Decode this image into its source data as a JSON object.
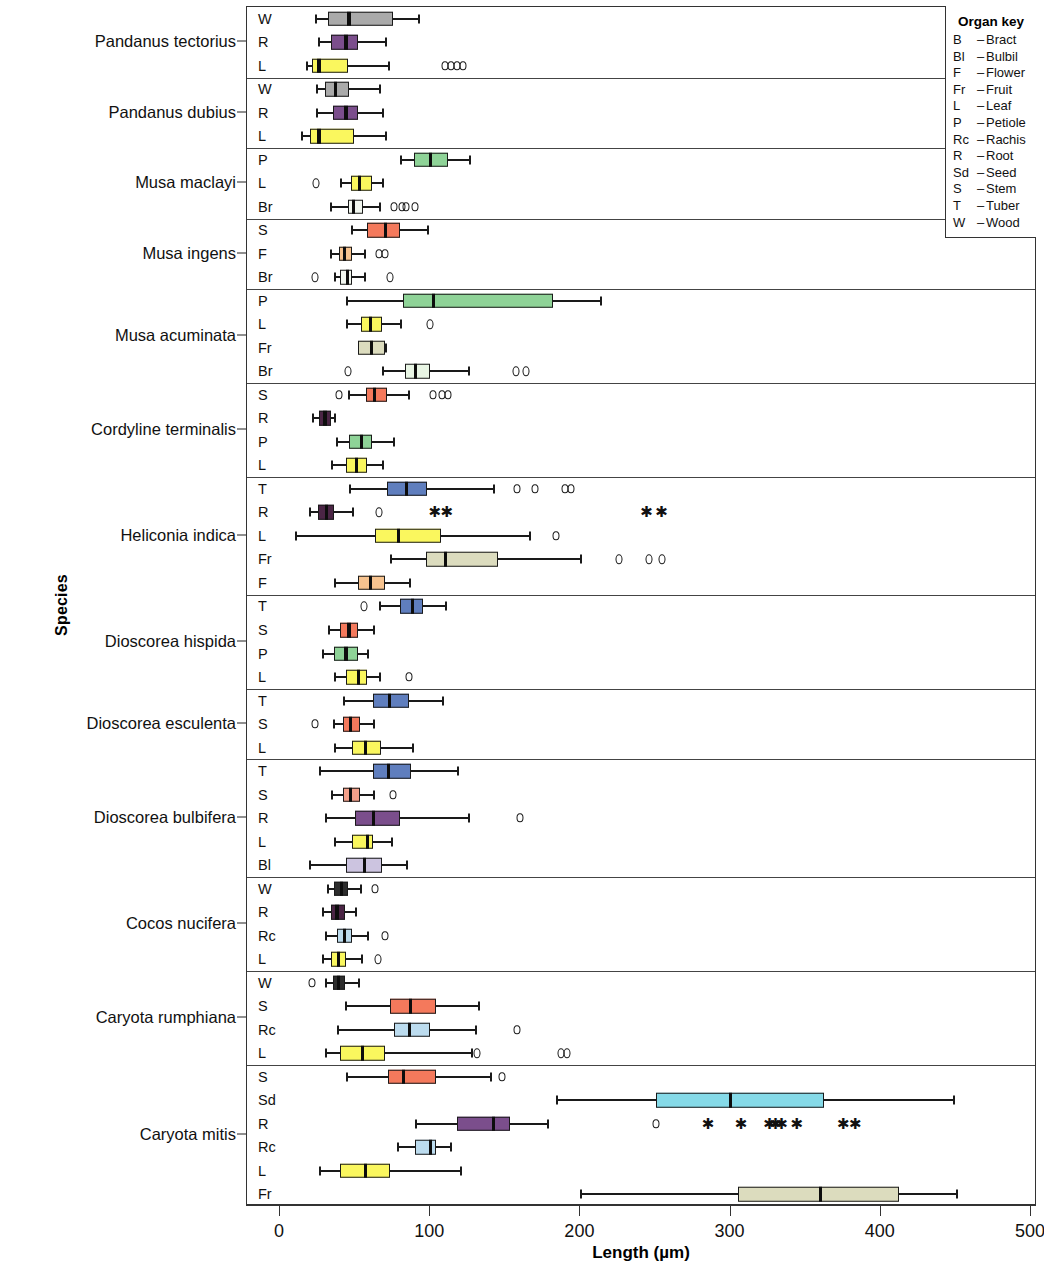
{
  "chart_data": {
    "type": "box",
    "title": "",
    "xlabel": "Length (µm)",
    "ylabel": "Species",
    "xlim": [
      0,
      500
    ],
    "xticks": [
      0,
      100,
      200,
      300,
      400,
      500
    ],
    "xtick_labels": [
      "0",
      "100",
      "200",
      "300",
      "400",
      "500"
    ],
    "grid": false,
    "legend_position": "top-right",
    "units": "micrometres",
    "organ_key": {
      "title": "Organ key",
      "entries": [
        {
          "abbr": "B",
          "dash": "–",
          "name": "Bract"
        },
        {
          "abbr": "Bl",
          "dash": "–",
          "name": "Bulbil"
        },
        {
          "abbr": "F",
          "dash": "–",
          "name": "Flower"
        },
        {
          "abbr": "Fr",
          "dash": "–",
          "name": "Fruit"
        },
        {
          "abbr": "L",
          "dash": "–",
          "name": "Leaf"
        },
        {
          "abbr": "P",
          "dash": "–",
          "name": "Petiole"
        },
        {
          "abbr": "Rc",
          "dash": "–",
          "name": "Rachis"
        },
        {
          "abbr": "R",
          "dash": "–",
          "name": "Root"
        },
        {
          "abbr": "Sd",
          "dash": "–",
          "name": "Seed"
        },
        {
          "abbr": "S",
          "dash": "–",
          "name": "Stem"
        },
        {
          "abbr": "T",
          "dash": "–",
          "name": "Tuber"
        },
        {
          "abbr": "W",
          "dash": "–",
          "name": "Wood"
        }
      ]
    },
    "organ_colors": {
      "B": "#e8f5e4",
      "Bl": "#ccc4e0",
      "F": "#f7c38f",
      "Fr": "#dcdcbe",
      "L": "#faf75e",
      "P": "#8ed397",
      "Rc": "#bcdcef",
      "R": "#7b4e8c",
      "Sd": "#85dae8",
      "S": "#f4795c",
      "T": "#5f7ebe",
      "W": "#aaaaaa",
      "Br": "#e8f5e4"
    },
    "groups": [
      {
        "species": "Pandanus tectorius",
        "rows": [
          {
            "organ": "W",
            "color": "#aaaaaa",
            "whisker_low": 23,
            "q1": 32,
            "median": 46,
            "q3": 75,
            "whisker_high": 92,
            "outliers": [],
            "extremes": []
          },
          {
            "organ": "R",
            "color": "#7b4e8c",
            "whisker_low": 25,
            "q1": 34,
            "median": 44,
            "q3": 52,
            "whisker_high": 70,
            "outliers": [],
            "extremes": []
          },
          {
            "organ": "L",
            "color": "#faf75e",
            "whisker_low": 17,
            "q1": 21,
            "median": 26,
            "q3": 45,
            "whisker_high": 72,
            "outliers": [
              110,
              114,
              118,
              122
            ],
            "extremes": []
          }
        ]
      },
      {
        "species": "Pandanus dubius",
        "rows": [
          {
            "organ": "W",
            "color": "#aaaaaa",
            "whisker_low": 24,
            "q1": 30,
            "median": 37,
            "q3": 46,
            "whisker_high": 66,
            "outliers": [],
            "extremes": []
          },
          {
            "organ": "R",
            "color": "#7b4e8c",
            "whisker_low": 24,
            "q1": 35,
            "median": 44,
            "q3": 52,
            "whisker_high": 68,
            "outliers": [],
            "extremes": []
          },
          {
            "organ": "L",
            "color": "#faf75e",
            "whisker_low": 14,
            "q1": 20,
            "median": 26,
            "q3": 49,
            "whisker_high": 70,
            "outliers": [],
            "extremes": []
          }
        ]
      },
      {
        "species": "Musa maclayi",
        "rows": [
          {
            "organ": "P",
            "color": "#8ed397",
            "whisker_low": 80,
            "q1": 89,
            "median": 100,
            "q3": 112,
            "whisker_high": 126,
            "outliers": [],
            "extremes": []
          },
          {
            "organ": "L",
            "color": "#faf75e",
            "whisker_low": 40,
            "q1": 47,
            "median": 53,
            "q3": 61,
            "whisker_high": 68,
            "outliers": [
              24
            ],
            "extremes": []
          },
          {
            "organ": "Br",
            "color": "#f2f7f0",
            "whisker_low": 33,
            "q1": 45,
            "median": 49,
            "q3": 55,
            "whisker_high": 66,
            "outliers": [
              76,
              81,
              84,
              90
            ],
            "extremes": []
          }
        ]
      },
      {
        "species": "Musa ingens",
        "rows": [
          {
            "organ": "S",
            "color": "#f4795c",
            "whisker_low": 47,
            "q1": 58,
            "median": 70,
            "q3": 80,
            "whisker_high": 98,
            "outliers": [],
            "extremes": []
          },
          {
            "organ": "F",
            "color": "#f7c38f",
            "whisker_low": 33,
            "q1": 39,
            "median": 43,
            "q3": 48,
            "whisker_high": 56,
            "outliers": [
              66,
              70
            ],
            "extremes": []
          },
          {
            "organ": "Br",
            "color": "#f2f7f0",
            "whisker_low": 36,
            "q1": 40,
            "median": 45,
            "q3": 48,
            "whisker_high": 56,
            "outliers": [
              23,
              73
            ],
            "extremes": []
          }
        ]
      },
      {
        "species": "Musa acuminata",
        "rows": [
          {
            "organ": "P",
            "color": "#8ed397",
            "whisker_low": 44,
            "q1": 82,
            "median": 102,
            "q3": 182,
            "whisker_high": 213,
            "outliers": [],
            "extremes": []
          },
          {
            "organ": "L",
            "color": "#faf75e",
            "whisker_low": 44,
            "q1": 54,
            "median": 60,
            "q3": 68,
            "whisker_high": 80,
            "outliers": [
              100
            ],
            "extremes": []
          },
          {
            "organ": "Fr",
            "color": "#dcdcbe",
            "whisker_low": 52,
            "q1": 52,
            "median": 61,
            "q3": 70,
            "whisker_high": 70,
            "outliers": [],
            "extremes": []
          },
          {
            "organ": "Br",
            "color": "#e8f5e4",
            "whisker_low": 68,
            "q1": 83,
            "median": 90,
            "q3": 100,
            "whisker_high": 125,
            "outliers": [
              45,
              157,
              164
            ],
            "extremes": []
          }
        ]
      },
      {
        "species": "Cordyline terminalis",
        "rows": [
          {
            "organ": "S",
            "color": "#f4795c",
            "whisker_low": 45,
            "q1": 57,
            "median": 63,
            "q3": 71,
            "whisker_high": 85,
            "outliers": [
              39,
              102,
              108,
              112
            ],
            "extremes": []
          },
          {
            "organ": "R",
            "color": "#4b2545",
            "whisker_low": 21,
            "q1": 26,
            "median": 30,
            "q3": 34,
            "whisker_high": 36,
            "outliers": [],
            "extremes": []
          },
          {
            "organ": "P",
            "color": "#8ed397",
            "whisker_low": 37,
            "q1": 46,
            "median": 54,
            "q3": 61,
            "whisker_high": 75,
            "outliers": [],
            "extremes": []
          },
          {
            "organ": "L",
            "color": "#faf75e",
            "whisker_low": 34,
            "q1": 44,
            "median": 51,
            "q3": 58,
            "whisker_high": 68,
            "outliers": [],
            "extremes": []
          }
        ]
      },
      {
        "species": "Heliconia indica",
        "rows": [
          {
            "organ": "T",
            "color": "#5f7ebe",
            "whisker_low": 46,
            "q1": 71,
            "median": 84,
            "q3": 98,
            "whisker_high": 142,
            "outliers": [
              158,
              170,
              190,
              194
            ],
            "extremes": []
          },
          {
            "organ": "R",
            "color": "#4b2545",
            "whisker_low": 19,
            "q1": 25,
            "median": 31,
            "q3": 36,
            "whisker_high": 48,
            "outliers": [
              66
            ],
            "extremes": [
              103,
              111,
              244,
              254
            ]
          },
          {
            "organ": "L",
            "color": "#faf75e",
            "whisker_low": 10,
            "q1": 63,
            "median": 79,
            "q3": 107,
            "whisker_high": 166,
            "outliers": [
              184
            ],
            "extremes": []
          },
          {
            "organ": "Fr",
            "color": "#dcdcbe",
            "whisker_low": 73,
            "q1": 97,
            "median": 110,
            "q3": 145,
            "whisker_high": 200,
            "outliers": [
              226,
              246,
              254
            ],
            "extremes": []
          },
          {
            "organ": "F",
            "color": "#f7c38f",
            "whisker_low": 36,
            "q1": 52,
            "median": 60,
            "q3": 70,
            "whisker_high": 86,
            "outliers": [],
            "extremes": []
          }
        ]
      },
      {
        "species": "Dioscorea hispida",
        "rows": [
          {
            "organ": "T",
            "color": "#5f7ebe",
            "whisker_low": 66,
            "q1": 80,
            "median": 88,
            "q3": 95,
            "whisker_high": 110,
            "outliers": [
              56
            ],
            "extremes": []
          },
          {
            "organ": "S",
            "color": "#f4795c",
            "whisker_low": 32,
            "q1": 40,
            "median": 46,
            "q3": 52,
            "whisker_high": 62,
            "outliers": [],
            "extremes": []
          },
          {
            "organ": "P",
            "color": "#8ed397",
            "whisker_low": 28,
            "q1": 36,
            "median": 44,
            "q3": 52,
            "whisker_high": 58,
            "outliers": [],
            "extremes": []
          },
          {
            "organ": "L",
            "color": "#faf75e",
            "whisker_low": 36,
            "q1": 44,
            "median": 52,
            "q3": 58,
            "whisker_high": 66,
            "outliers": [
              86
            ],
            "extremes": []
          }
        ]
      },
      {
        "species": "Dioscorea esculenta",
        "rows": [
          {
            "organ": "T",
            "color": "#5f7ebe",
            "whisker_low": 42,
            "q1": 62,
            "median": 73,
            "q3": 86,
            "whisker_high": 108,
            "outliers": [],
            "extremes": []
          },
          {
            "organ": "S",
            "color": "#f4795c",
            "whisker_low": 35,
            "q1": 42,
            "median": 47,
            "q3": 53,
            "whisker_high": 62,
            "outliers": [
              23
            ],
            "extremes": []
          },
          {
            "organ": "L",
            "color": "#faf75e",
            "whisker_low": 36,
            "q1": 48,
            "median": 57,
            "q3": 67,
            "whisker_high": 88,
            "outliers": [],
            "extremes": []
          }
        ]
      },
      {
        "species": "Dioscorea bulbifera",
        "rows": [
          {
            "organ": "T",
            "color": "#5f7ebe",
            "whisker_low": 26,
            "q1": 62,
            "median": 72,
            "q3": 87,
            "whisker_high": 118,
            "outliers": [],
            "extremes": []
          },
          {
            "organ": "S",
            "color": "#f4a08a",
            "whisker_low": 34,
            "q1": 42,
            "median": 47,
            "q3": 53,
            "whisker_high": 62,
            "outliers": [
              75
            ],
            "extremes": []
          },
          {
            "organ": "R",
            "color": "#7b4e8c",
            "whisker_low": 30,
            "q1": 50,
            "median": 62,
            "q3": 80,
            "whisker_high": 125,
            "outliers": [
              160
            ],
            "extremes": []
          },
          {
            "organ": "L",
            "color": "#faf75e",
            "whisker_low": 36,
            "q1": 48,
            "median": 58,
            "q3": 62,
            "whisker_high": 74,
            "outliers": [],
            "extremes": []
          },
          {
            "organ": "Bl",
            "color": "#ccc4e0",
            "whisker_low": 19,
            "q1": 44,
            "median": 56,
            "q3": 68,
            "whisker_high": 84,
            "outliers": [],
            "extremes": []
          }
        ]
      },
      {
        "species": "Cocos nucifera",
        "rows": [
          {
            "organ": "W",
            "color": "#2d2d2d",
            "whisker_low": 31,
            "q1": 36,
            "median": 41,
            "q3": 45,
            "whisker_high": 53,
            "outliers": [
              63
            ],
            "extremes": []
          },
          {
            "organ": "R",
            "color": "#4b2545",
            "whisker_low": 28,
            "q1": 34,
            "median": 38,
            "q3": 43,
            "whisker_high": 50,
            "outliers": [],
            "extremes": []
          },
          {
            "organ": "Rc",
            "color": "#bcdcef",
            "whisker_low": 30,
            "q1": 38,
            "median": 43,
            "q3": 48,
            "whisker_high": 58,
            "outliers": [
              70
            ],
            "extremes": []
          },
          {
            "organ": "L",
            "color": "#faf75e",
            "whisker_low": 28,
            "q1": 34,
            "median": 39,
            "q3": 44,
            "whisker_high": 54,
            "outliers": [
              65
            ],
            "extremes": []
          }
        ]
      },
      {
        "species": "Caryota rumphiana",
        "rows": [
          {
            "organ": "W",
            "color": "#2d2d2d",
            "whisker_low": 30,
            "q1": 35,
            "median": 39,
            "q3": 43,
            "whisker_high": 52,
            "outliers": [
              21
            ],
            "extremes": []
          },
          {
            "organ": "S",
            "color": "#f4795c",
            "whisker_low": 43,
            "q1": 73,
            "median": 87,
            "q3": 104,
            "whisker_high": 132,
            "outliers": [],
            "extremes": []
          },
          {
            "organ": "Rc",
            "color": "#bcdcef",
            "whisker_low": 38,
            "q1": 76,
            "median": 86,
            "q3": 100,
            "whisker_high": 130,
            "outliers": [
              158
            ],
            "extremes": []
          },
          {
            "organ": "L",
            "color": "#faf75e",
            "whisker_low": 30,
            "q1": 40,
            "median": 55,
            "q3": 70,
            "whisker_high": 127,
            "outliers": [
              131,
              187,
              191
            ],
            "extremes": []
          }
        ]
      },
      {
        "species": "Caryota mitis",
        "rows": [
          {
            "organ": "S",
            "color": "#f4795c",
            "whisker_low": 44,
            "q1": 72,
            "median": 82,
            "q3": 104,
            "whisker_high": 140,
            "outliers": [
              148
            ],
            "extremes": []
          },
          {
            "organ": "Sd",
            "color": "#85dae8",
            "whisker_low": 184,
            "q1": 250,
            "median": 300,
            "q3": 362,
            "whisker_high": 448,
            "outliers": [],
            "extremes": []
          },
          {
            "organ": "R",
            "color": "#7b4e8c",
            "whisker_low": 90,
            "q1": 118,
            "median": 142,
            "q3": 153,
            "whisker_high": 178,
            "outliers": [
              250
            ],
            "extremes": [
              285,
              307,
              326,
              330,
              334,
              344,
              375,
              383
            ]
          },
          {
            "organ": "Rc",
            "color": "#bcdcef",
            "whisker_low": 78,
            "q1": 90,
            "median": 100,
            "q3": 104,
            "whisker_high": 113,
            "outliers": [],
            "extremes": []
          },
          {
            "organ": "L",
            "color": "#faf75e",
            "whisker_low": 26,
            "q1": 40,
            "median": 57,
            "q3": 73,
            "whisker_high": 120,
            "outliers": [],
            "extremes": []
          },
          {
            "organ": "Fr",
            "color": "#dcdcbe",
            "whisker_low": 200,
            "q1": 305,
            "median": 360,
            "q3": 412,
            "whisker_high": 450,
            "outliers": [],
            "extremes": []
          }
        ]
      }
    ]
  }
}
